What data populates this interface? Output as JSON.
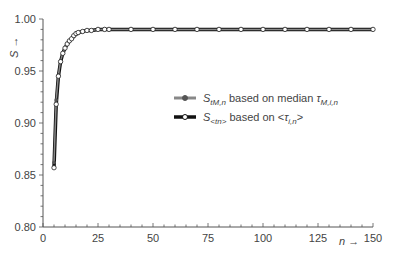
{
  "chart_data": {
    "type": "line",
    "title": "",
    "xlabel": "n →",
    "ylabel": "S →",
    "xlim": [
      0,
      150
    ],
    "ylim": [
      0.8,
      1.0
    ],
    "grid": false,
    "legend_position": "center-right",
    "x_ticks": [
      "0",
      "25",
      "50",
      "75",
      "100",
      "125",
      "150"
    ],
    "y_ticks": [
      "0.80",
      "0.85",
      "0.90",
      "0.95",
      "1.00"
    ],
    "series": [
      {
        "name": "S_tM,n based on median τ_M,i,n",
        "legend_label_main": "S",
        "legend_label_sub": "tM,n",
        "legend_label_rest": " based on median ",
        "legend_label_tau": "τ",
        "legend_label_tau_sub": "M,i,n",
        "color": "#888888",
        "marker": "filled-circle",
        "x": [
          5,
          6,
          7,
          8,
          9,
          10,
          11,
          12,
          13,
          14,
          15,
          16,
          18,
          20,
          22,
          25,
          28,
          30,
          40,
          50,
          60,
          70,
          80,
          90,
          100,
          110,
          120,
          130,
          140,
          150
        ],
        "values": [
          0.862,
          0.922,
          0.946,
          0.96,
          0.967,
          0.972,
          0.976,
          0.979,
          0.981,
          0.983,
          0.985,
          0.986,
          0.988,
          0.989,
          0.989,
          0.99,
          0.99,
          0.99,
          0.99,
          0.99,
          0.99,
          0.99,
          0.99,
          0.99,
          0.99,
          0.99,
          0.99,
          0.99,
          0.99,
          0.99
        ]
      },
      {
        "name": "S_<tn> based on <τ_i,n>",
        "legend_label_main": "S",
        "legend_label_sub": "<tn>",
        "legend_label_rest": " based on <",
        "legend_label_tau": "τ",
        "legend_label_tau_sub": "i,n",
        "legend_label_end": ">",
        "color": "#111111",
        "marker": "open-circle",
        "x": [
          5,
          6,
          7,
          8,
          9,
          10,
          11,
          12,
          13,
          14,
          15,
          16,
          18,
          20,
          22,
          25,
          28,
          30,
          40,
          50,
          60,
          70,
          80,
          90,
          100,
          110,
          120,
          130,
          140,
          150
        ],
        "values": [
          0.857,
          0.918,
          0.945,
          0.959,
          0.967,
          0.972,
          0.976,
          0.979,
          0.981,
          0.984,
          0.986,
          0.987,
          0.988,
          0.989,
          0.989,
          0.99,
          0.99,
          0.99,
          0.99,
          0.99,
          0.99,
          0.99,
          0.99,
          0.99,
          0.99,
          0.99,
          0.99,
          0.99,
          0.99,
          0.99
        ]
      }
    ]
  }
}
